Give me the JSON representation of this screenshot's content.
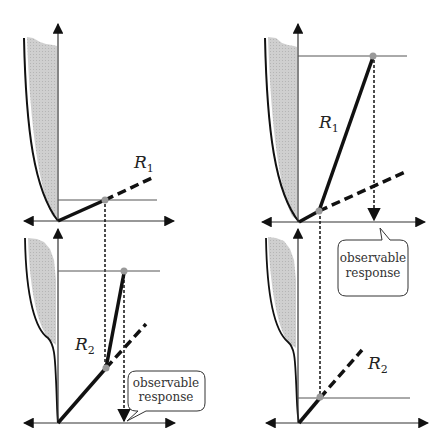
{
  "figure": {
    "colors": {
      "stroke": "#111111",
      "fill_region": "#c9c9c9",
      "marker": "#999999",
      "thin_line": "#444444"
    }
  },
  "panels": {
    "top_left": {
      "curve_label_main": "R",
      "curve_label_sub": "1"
    },
    "top_right": {
      "curve_label_main": "R",
      "curve_label_sub": "1",
      "callout": {
        "line1": "observable",
        "line2": "response"
      }
    },
    "bottom_left": {
      "curve_label_main": "R",
      "curve_label_sub": "2",
      "callout": {
        "line1": "observable",
        "line2": "response"
      }
    },
    "bottom_right": {
      "curve_label_main": "R",
      "curve_label_sub": "2"
    }
  }
}
